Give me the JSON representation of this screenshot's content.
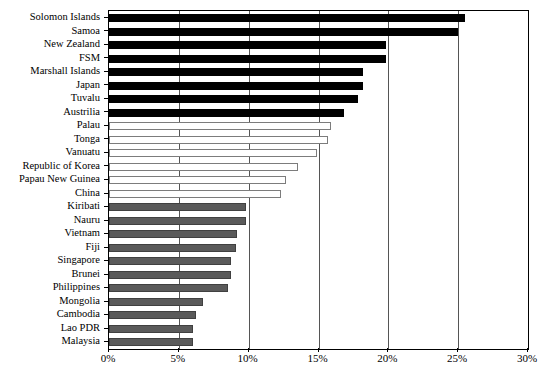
{
  "chart_data": {
    "type": "bar",
    "orientation": "horizontal",
    "title": "",
    "subtitle": "",
    "xlabel": "",
    "ylabel": "",
    "xlim": [
      0,
      30
    ],
    "xtick_labels": [
      "0%",
      "5%",
      "10%",
      "15%",
      "20%",
      "25%",
      "30%"
    ],
    "xtick_values": [
      0,
      5,
      10,
      15,
      20,
      25,
      30
    ],
    "grid": "vertical",
    "legend": [],
    "value_unit": "%",
    "group_colors": {
      "high": "#000000",
      "medium": "#ffffff",
      "low": "#5a5a5a"
    },
    "categories": [
      "Solomon Islands",
      "Samoa",
      "New Zealand",
      "FSM",
      "Marshall Islands",
      "Japan",
      "Tuvalu",
      "Austrilia",
      "Palau",
      "Tonga",
      "Vanuatu",
      "Republic of Korea",
      "Papau New Guinea",
      "China",
      "Kiribati",
      "Nauru",
      "Vietnam",
      "Fiji",
      "Singapore",
      "Brunei",
      "Philippines",
      "Mongolia",
      "Cambodia",
      "Lao PDR",
      "Malaysia"
    ],
    "values": [
      25.5,
      25.0,
      19.8,
      19.8,
      18.2,
      18.2,
      17.8,
      16.8,
      15.9,
      15.7,
      14.9,
      13.5,
      12.7,
      12.3,
      9.8,
      9.8,
      9.2,
      9.1,
      8.7,
      8.7,
      8.5,
      6.7,
      6.2,
      6.0,
      6.0
    ],
    "bars": [
      {
        "label": "Solomon Islands",
        "value": 25.5,
        "style": "black"
      },
      {
        "label": "Samoa",
        "value": 25.0,
        "style": "black"
      },
      {
        "label": "New Zealand",
        "value": 19.8,
        "style": "black"
      },
      {
        "label": "FSM",
        "value": 19.8,
        "style": "black"
      },
      {
        "label": "Marshall Islands",
        "value": 18.2,
        "style": "black"
      },
      {
        "label": "Japan",
        "value": 18.2,
        "style": "black"
      },
      {
        "label": "Tuvalu",
        "value": 17.8,
        "style": "black"
      },
      {
        "label": "Austrilia",
        "value": 16.8,
        "style": "black"
      },
      {
        "label": "Palau",
        "value": 15.9,
        "style": "white"
      },
      {
        "label": "Tonga",
        "value": 15.7,
        "style": "white"
      },
      {
        "label": "Vanuatu",
        "value": 14.9,
        "style": "white"
      },
      {
        "label": "Republic of Korea",
        "value": 13.5,
        "style": "white"
      },
      {
        "label": "Papau New Guinea",
        "value": 12.7,
        "style": "white"
      },
      {
        "label": "China",
        "value": 12.3,
        "style": "white"
      },
      {
        "label": "Kiribati",
        "value": 9.8,
        "style": "gray"
      },
      {
        "label": "Nauru",
        "value": 9.8,
        "style": "gray"
      },
      {
        "label": "Vietnam",
        "value": 9.2,
        "style": "gray"
      },
      {
        "label": "Fiji",
        "value": 9.1,
        "style": "gray"
      },
      {
        "label": "Singapore",
        "value": 8.7,
        "style": "gray"
      },
      {
        "label": "Brunei",
        "value": 8.7,
        "style": "gray"
      },
      {
        "label": "Philippines",
        "value": 8.5,
        "style": "gray"
      },
      {
        "label": "Mongolia",
        "value": 6.7,
        "style": "gray"
      },
      {
        "label": "Cambodia",
        "value": 6.2,
        "style": "gray"
      },
      {
        "label": "Lao PDR",
        "value": 6.0,
        "style": "gray"
      },
      {
        "label": "Malaysia",
        "value": 6.0,
        "style": "gray"
      }
    ]
  }
}
